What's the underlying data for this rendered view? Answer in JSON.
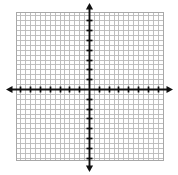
{
  "chart_data": {
    "type": "line",
    "title": "",
    "subtitle": "",
    "xlabel": "",
    "ylabel": "",
    "description": "Blank Cartesian coordinate grid with x-axis and y-axis drawn as double-headed arrows through the origin, fine square gridlines, and evenly spaced tick marks along both axes.",
    "xlim": [
      -15,
      15
    ],
    "ylim": [
      -15,
      15
    ],
    "grid": true,
    "grid_step": 1,
    "tick_step": 2,
    "x_ticks": [
      -14,
      -12,
      -10,
      -8,
      -6,
      -4,
      -2,
      0,
      2,
      4,
      6,
      8,
      10,
      12,
      14
    ],
    "y_ticks": [
      -14,
      -12,
      -10,
      -8,
      -6,
      -4,
      -2,
      0,
      2,
      4,
      6,
      8,
      10,
      12,
      14
    ],
    "x_tick_labels": [],
    "y_tick_labels": [],
    "legend": [],
    "legend_position": "none",
    "annotations": [],
    "series": [],
    "origin_label": "",
    "axis_arrows": {
      "x_negative": true,
      "x_positive": true,
      "y_positive": true,
      "y_negative": true
    }
  },
  "colors": {
    "background": "#ffffff",
    "grid_line": "#b9b9b9",
    "grid_border": "#a8a8a8",
    "axis": "#111111",
    "tick": "#111111"
  },
  "geometry": {
    "grid_left": 16,
    "grid_top": 12,
    "grid_right": 163,
    "grid_bottom": 160,
    "origin_x": 89,
    "origin_y": 89,
    "cell_px": 4.9,
    "tick_half_len": 3.0,
    "axis_arrow_left_x": 6,
    "axis_arrow_right_x": 173,
    "axis_arrow_top_y": 3,
    "axis_arrow_bottom_y": 172
  },
  "alt": {
    "figure_label": "blank-coordinate-plane"
  }
}
